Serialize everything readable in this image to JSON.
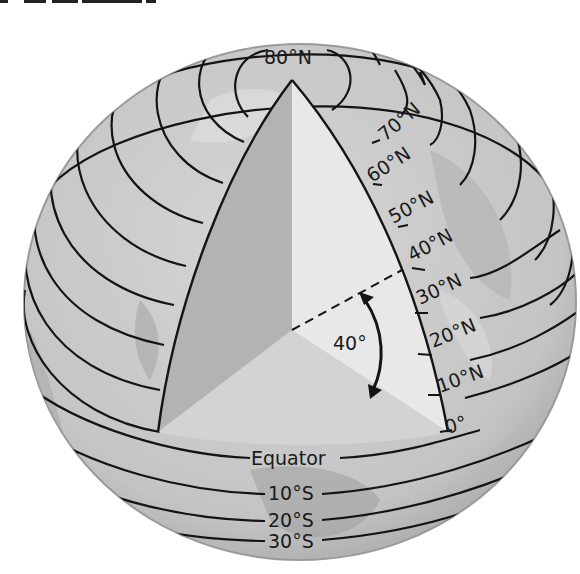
{
  "diagram": {
    "title_fragment": "",
    "colors": {
      "globe_fill": "#c9c9c9",
      "globe_edge": "#8c8c8c",
      "wedge_left": "#b3b3b3",
      "wedge_right": "#e6e6e6",
      "wedge_bottom": "#d2d2d2",
      "line": "#141414",
      "background": "#ffffff"
    },
    "north_labels": {
      "n80": "80°N",
      "n70": "70°N",
      "n60": "60°N",
      "n50": "50°N",
      "n40": "40°N",
      "n30": "30°N",
      "n20": "20°N",
      "n10": "10°N",
      "n0": "0°"
    },
    "south_labels": {
      "equator": "Equator",
      "s10": "10°S",
      "s20": "20°S",
      "s30": "30°S"
    },
    "angle": {
      "label": "40°",
      "degrees": 40
    }
  }
}
